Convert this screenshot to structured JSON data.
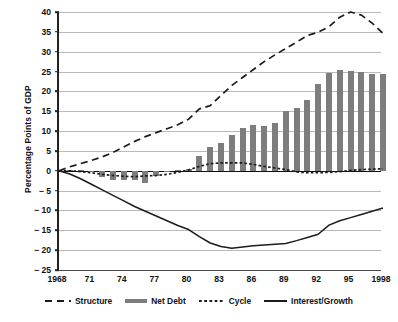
{
  "chart_data": {
    "type": "bar",
    "title": "",
    "subtitle": "",
    "xlabel": "",
    "ylabel": "Percentage Points of GDP",
    "xlim": [
      1968,
      1998
    ],
    "ylim": [
      -25,
      40
    ],
    "ytick_values": [
      40,
      35,
      30,
      25,
      20,
      15,
      10,
      5,
      0,
      -5,
      -10,
      -15,
      -20,
      -25
    ],
    "ytick_labels": [
      "40",
      "35",
      "30",
      "25",
      "20",
      "15",
      "10",
      "5",
      "0",
      "− 5",
      "− 10",
      "− 15",
      "− 20",
      "− 25"
    ],
    "xtick_values": [
      1968,
      1971,
      1974,
      1977,
      1980,
      1983,
      1986,
      1989,
      1992,
      1995,
      1998
    ],
    "xtick_labels": [
      "1968",
      "71",
      "74",
      "77",
      "80",
      "83",
      "86",
      "89",
      "92",
      "95",
      "1998"
    ],
    "grid": "horizontal",
    "legend_position": "bottom",
    "x": [
      1968,
      1969,
      1970,
      1971,
      1972,
      1973,
      1974,
      1975,
      1976,
      1977,
      1978,
      1979,
      1980,
      1981,
      1982,
      1983,
      1984,
      1985,
      1986,
      1987,
      1988,
      1989,
      1990,
      1991,
      1992,
      1993,
      1994,
      1995,
      1996,
      1997,
      1998
    ],
    "series": [
      {
        "name": "Net Debt",
        "type": "bar",
        "color": "#7d7d7d",
        "values": [
          0.0,
          0.3,
          0.2,
          -0.3,
          -1.6,
          -2.3,
          -2.4,
          -2.4,
          -3.0,
          -1.4,
          -0.3,
          0.1,
          0.4,
          3.8,
          6.0,
          7.1,
          9.0,
          10.7,
          11.6,
          11.4,
          12.0,
          15.1,
          15.8,
          17.8,
          21.9,
          24.7,
          25.3,
          25.2,
          24.8,
          24.4,
          24.4
        ]
      },
      {
        "name": "Structure",
        "type": "line",
        "style": "long-dashed",
        "color": "#1c1c1c",
        "values": [
          0.0,
          1.0,
          1.8,
          2.6,
          3.5,
          4.6,
          6.0,
          7.4,
          8.6,
          9.6,
          10.6,
          11.6,
          13.0,
          15.6,
          16.4,
          19.0,
          21.5,
          23.5,
          25.5,
          27.5,
          29.2,
          30.8,
          32.4,
          34.1,
          34.9,
          36.3,
          38.7,
          40.0,
          39.2,
          37.2,
          34.6
        ]
      },
      {
        "name": "Cycle",
        "type": "line",
        "style": "short-dashed",
        "color": "#1c1c1c",
        "values": [
          0.0,
          0.0,
          -0.2,
          -0.5,
          -0.9,
          -1.2,
          -1.4,
          -1.5,
          -1.3,
          -1.2,
          -0.9,
          -0.4,
          0.2,
          1.1,
          1.8,
          2.0,
          2.0,
          2.0,
          1.6,
          1.1,
          0.7,
          0.3,
          -0.3,
          -0.5,
          -0.5,
          -0.4,
          -0.2,
          0.1,
          0.3,
          0.4,
          0.5
        ]
      },
      {
        "name": "Interest/Growth",
        "type": "line",
        "style": "solid",
        "color": "#1c1c1c",
        "values": [
          0.0,
          -0.8,
          -2.0,
          -3.4,
          -4.8,
          -6.2,
          -7.6,
          -9.0,
          -10.2,
          -11.4,
          -12.6,
          -13.8,
          -14.8,
          -16.6,
          -18.2,
          -19.1,
          -19.5,
          -19.2,
          -18.9,
          -18.7,
          -18.5,
          -18.3,
          -17.6,
          -16.8,
          -16.0,
          -13.7,
          -12.6,
          -11.8,
          -11.0,
          -10.2,
          -9.4
        ]
      }
    ]
  },
  "legend": {
    "items": [
      {
        "label": "Structure",
        "swatch": "long-dash-swatch"
      },
      {
        "label": "Net Debt",
        "swatch": "bar-swatch"
      },
      {
        "label": "Cycle",
        "swatch": "short-dash-swatch"
      },
      {
        "label": "Interest/Growth",
        "swatch": "solid-line-swatch"
      }
    ]
  },
  "axis": {
    "y_title": "Percentage Points of GDP"
  }
}
